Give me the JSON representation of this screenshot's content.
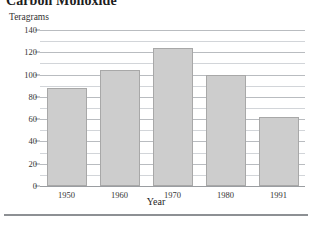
{
  "chart_data": {
    "type": "bar",
    "title": "Carbon Monoxide",
    "ylabel": "Teragrams",
    "xlabel": "Year",
    "categories": [
      "1950",
      "1960",
      "1970",
      "1980",
      "1991"
    ],
    "values": [
      88,
      104,
      124,
      100,
      62
    ],
    "ylim": [
      0,
      140
    ],
    "ytick_labels": [
      "0",
      "20",
      "40",
      "60",
      "80",
      "100",
      "120",
      "140"
    ],
    "ytick_values": [
      0,
      20,
      40,
      60,
      80,
      100,
      120,
      140
    ],
    "minor_gridline_values": [
      10,
      30,
      50,
      70,
      90,
      110,
      130
    ],
    "grid": true,
    "legend": "none",
    "bar_color": "#cdcdcd",
    "bar_border_color": "#a8a8a8",
    "gridline_color": "#b9bcc0"
  }
}
